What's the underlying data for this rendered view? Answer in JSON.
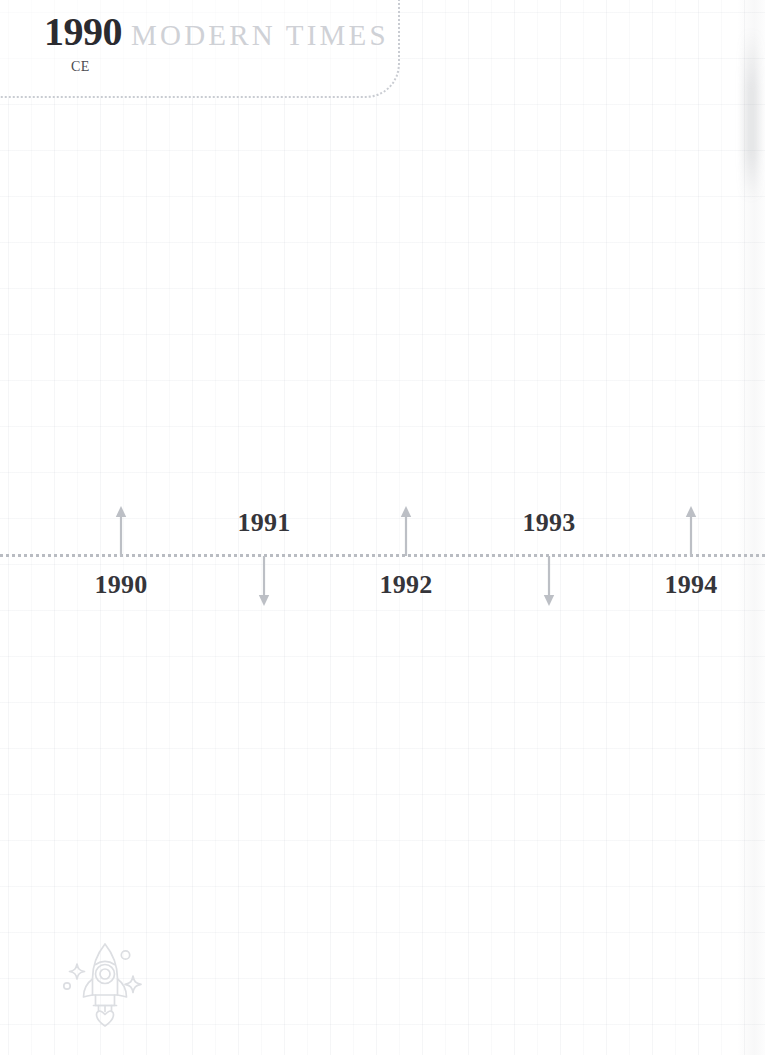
{
  "page": {
    "background_color": "#ffffff",
    "grid_color": "#e8eaee",
    "width": 765,
    "height": 1055
  },
  "era_header": {
    "year": "1990",
    "era_suffix": "CE",
    "era_name": "MODERN TIMES",
    "year_color": "#2b2b30",
    "era_name_color": "#cfd1d6",
    "border_style": "dotted",
    "border_color": "#c9ccd2"
  },
  "timeline": {
    "axis_color": "#b9bcc2",
    "axis_y": 554,
    "label_color": "#35353a",
    "arrow_color": "#bcbfc5",
    "markers": [
      {
        "year": "1990",
        "x": 121,
        "label_position": "below",
        "arrow_direction": "up"
      },
      {
        "year": "1991",
        "x": 264,
        "label_position": "above",
        "arrow_direction": "down"
      },
      {
        "year": "1992",
        "x": 406,
        "label_position": "below",
        "arrow_direction": "up"
      },
      {
        "year": "1993",
        "x": 549,
        "label_position": "above",
        "arrow_direction": "down"
      },
      {
        "year": "1994",
        "x": 691,
        "label_position": "below",
        "arrow_direction": "up"
      }
    ]
  },
  "decoration": {
    "icon": "rocket-icon",
    "color": "#dcdee2"
  }
}
